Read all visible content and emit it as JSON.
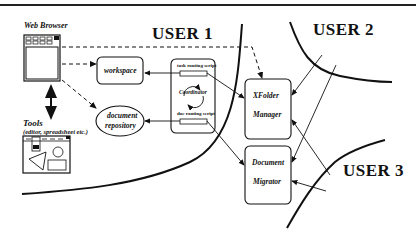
{
  "users": {
    "user1": "USER 1",
    "user2": "USER 2",
    "user3": "USER 3"
  },
  "client": {
    "browser_label": "Web Browser",
    "tools_label": "Tools",
    "tools_sublabel": "(editor, spreadsheet etc.)"
  },
  "nodes": {
    "workspace": "workspace",
    "document_repository_line1": "document",
    "document_repository_line2": "repository",
    "task_routing_script": "task routing script",
    "coordinator": "Coordinator",
    "doc_routing_script": "doc routing script",
    "xfolder_manager_line1": "XFolder",
    "xfolder_manager_line2": "Manager",
    "document_migrator_line1": "Document",
    "document_migrator_line2": "Migrator"
  },
  "colors": {
    "stroke": "#111111",
    "background": "#ffffff"
  }
}
